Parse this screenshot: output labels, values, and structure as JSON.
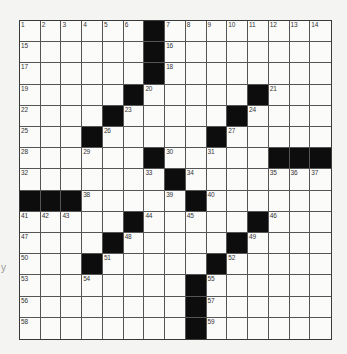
{
  "puzzle": {
    "rows": 15,
    "cols": 15,
    "colors": {
      "black_square": "#0d0d0d",
      "white_square": "#fbfbfa",
      "grid_line": "#555555"
    },
    "black_squares": [
      [
        1,
        7
      ],
      [
        2,
        7
      ],
      [
        3,
        7
      ],
      [
        4,
        6
      ],
      [
        4,
        12
      ],
      [
        5,
        5
      ],
      [
        5,
        11
      ],
      [
        6,
        4
      ],
      [
        6,
        10
      ],
      [
        7,
        7
      ],
      [
        7,
        13
      ],
      [
        7,
        14
      ],
      [
        7,
        15
      ],
      [
        8,
        8
      ],
      [
        9,
        1
      ],
      [
        9,
        2
      ],
      [
        9,
        3
      ],
      [
        9,
        9
      ],
      [
        10,
        6
      ],
      [
        10,
        12
      ],
      [
        11,
        5
      ],
      [
        11,
        11
      ],
      [
        12,
        4
      ],
      [
        12,
        10
      ],
      [
        13,
        9
      ],
      [
        14,
        9
      ],
      [
        15,
        9
      ]
    ],
    "numbered_squares": [
      {
        "r": 1,
        "c": 1,
        "n": "1"
      },
      {
        "r": 1,
        "c": 2,
        "n": "2"
      },
      {
        "r": 1,
        "c": 3,
        "n": "3"
      },
      {
        "r": 1,
        "c": 4,
        "n": "4"
      },
      {
        "r": 1,
        "c": 5,
        "n": "5"
      },
      {
        "r": 1,
        "c": 6,
        "n": "6"
      },
      {
        "r": 1,
        "c": 8,
        "n": "7"
      },
      {
        "r": 1,
        "c": 9,
        "n": "8"
      },
      {
        "r": 1,
        "c": 10,
        "n": "9"
      },
      {
        "r": 1,
        "c": 11,
        "n": "10"
      },
      {
        "r": 1,
        "c": 12,
        "n": "11"
      },
      {
        "r": 1,
        "c": 13,
        "n": "12"
      },
      {
        "r": 1,
        "c": 14,
        "n": "13"
      },
      {
        "r": 1,
        "c": 15,
        "n": "14"
      },
      {
        "r": 2,
        "c": 1,
        "n": "15"
      },
      {
        "r": 2,
        "c": 8,
        "n": "16"
      },
      {
        "r": 3,
        "c": 1,
        "n": "17"
      },
      {
        "r": 3,
        "c": 8,
        "n": "18"
      },
      {
        "r": 4,
        "c": 1,
        "n": "19"
      },
      {
        "r": 4,
        "c": 7,
        "n": "20"
      },
      {
        "r": 4,
        "c": 13,
        "n": "21"
      },
      {
        "r": 5,
        "c": 1,
        "n": "22"
      },
      {
        "r": 5,
        "c": 6,
        "n": "23"
      },
      {
        "r": 5,
        "c": 12,
        "n": "24"
      },
      {
        "r": 6,
        "c": 1,
        "n": "25"
      },
      {
        "r": 6,
        "c": 5,
        "n": "26"
      },
      {
        "r": 6,
        "c": 11,
        "n": "27"
      },
      {
        "r": 7,
        "c": 1,
        "n": "28"
      },
      {
        "r": 7,
        "c": 4,
        "n": "29"
      },
      {
        "r": 7,
        "c": 8,
        "n": "30"
      },
      {
        "r": 7,
        "c": 10,
        "n": "31"
      },
      {
        "r": 8,
        "c": 1,
        "n": "32"
      },
      {
        "r": 8,
        "c": 7,
        "n": "33"
      },
      {
        "r": 8,
        "c": 9,
        "n": "34"
      },
      {
        "r": 8,
        "c": 13,
        "n": "35"
      },
      {
        "r": 8,
        "c": 14,
        "n": "36"
      },
      {
        "r": 8,
        "c": 15,
        "n": "37"
      },
      {
        "r": 9,
        "c": 4,
        "n": "38"
      },
      {
        "r": 9,
        "c": 8,
        "n": "39"
      },
      {
        "r": 9,
        "c": 10,
        "n": "40"
      },
      {
        "r": 10,
        "c": 1,
        "n": "41"
      },
      {
        "r": 10,
        "c": 2,
        "n": "42"
      },
      {
        "r": 10,
        "c": 3,
        "n": "43"
      },
      {
        "r": 10,
        "c": 7,
        "n": "44"
      },
      {
        "r": 10,
        "c": 9,
        "n": "45"
      },
      {
        "r": 10,
        "c": 13,
        "n": "46"
      },
      {
        "r": 11,
        "c": 1,
        "n": "47"
      },
      {
        "r": 11,
        "c": 6,
        "n": "48"
      },
      {
        "r": 11,
        "c": 12,
        "n": "49"
      },
      {
        "r": 12,
        "c": 1,
        "n": "50"
      },
      {
        "r": 12,
        "c": 5,
        "n": "51"
      },
      {
        "r": 12,
        "c": 11,
        "n": "52"
      },
      {
        "r": 13,
        "c": 1,
        "n": "53"
      },
      {
        "r": 13,
        "c": 4,
        "n": "54"
      },
      {
        "r": 13,
        "c": 10,
        "n": "55"
      },
      {
        "r": 14,
        "c": 1,
        "n": "56"
      },
      {
        "r": 14,
        "c": 10,
        "n": "57"
      },
      {
        "r": 15,
        "c": 1,
        "n": "58"
      },
      {
        "r": 15,
        "c": 10,
        "n": "59"
      }
    ]
  },
  "margin_mark": "y"
}
